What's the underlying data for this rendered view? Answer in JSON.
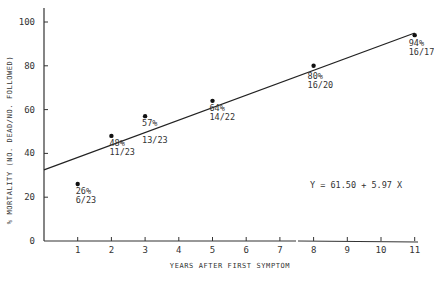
{
  "chart_data": {
    "type": "scatter",
    "title": "",
    "xlabel": "Years after first symptom",
    "ylabel": "% Mortality (No. dead/No. followed)",
    "xlim": [
      0,
      11
    ],
    "ylim": [
      0,
      100
    ],
    "x_ticks": [
      0,
      1,
      2,
      3,
      4,
      5,
      6,
      7,
      8,
      9,
      10,
      11
    ],
    "y_ticks": [
      0,
      20,
      40,
      60,
      80,
      100
    ],
    "axis_break": "between 7 and 8 on x-axis",
    "grid": false,
    "points": [
      {
        "x": 1,
        "y": 26,
        "pct_label": "26%",
        "ratio_label": "6/23"
      },
      {
        "x": 2,
        "y": 48,
        "pct_label": "48%",
        "ratio_label": "11/23"
      },
      {
        "x": 3,
        "y": 57,
        "pct_label": "57%",
        "ratio_label": "13/23"
      },
      {
        "x": 5,
        "y": 64,
        "pct_label": "64%",
        "ratio_label": "14/22"
      },
      {
        "x": 8,
        "y": 80,
        "pct_label": "80%",
        "ratio_label": "16/20"
      },
      {
        "x": 11,
        "y": 94,
        "pct_label": "94%",
        "ratio_label": "16/17"
      }
    ],
    "regression": {
      "intercept": 61.5,
      "slope": 5.97,
      "label": "Y = 61.50 + 5.97 X",
      "line_from": [
        0,
        32.5
      ],
      "line_to": [
        11,
        95
      ]
    }
  }
}
